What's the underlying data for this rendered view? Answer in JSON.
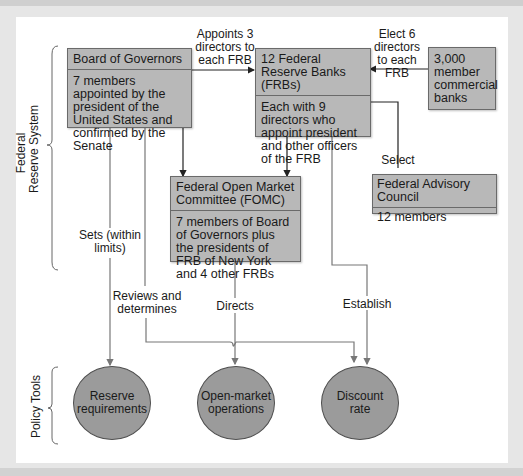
{
  "diagram": {
    "groups": {
      "federal_reserve_system": "Federal\nReserve System",
      "federal_reserve_system_line1": "Federal",
      "federal_reserve_system_line2": "Reserve System",
      "policy_tools": "Policy Tools"
    },
    "boxes": {
      "board_of_governors": {
        "title": "Board of Governors",
        "body": "7 members appointed by the president of the United States and confirmed by the Senate"
      },
      "frbs": {
        "title": "12 Federal Reserve Banks (FRBs)",
        "body": "Each with 9 directors who appoint president and other officers of the FRB"
      },
      "member_banks": {
        "body": "3,000 member commercial banks"
      },
      "fomc": {
        "title": "Federal Open Market Committee (FOMC)",
        "body": "7 members of Board of Governors plus the presidents of FRB of New York and 4 other FRBs"
      },
      "advisory_council": {
        "title": "Federal Advisory Council",
        "body": "12 members"
      }
    },
    "edge_labels": {
      "appoints": "Appoints 3 directors to each FRB",
      "elect": "Elect 6 directors to each FRB",
      "select": "Select",
      "sets": "Sets (within limits)",
      "reviews": "Reviews and determines",
      "directs": "Directs",
      "establish": "Establish"
    },
    "tools": {
      "reserve": "Reserve requirements",
      "omo": "Open-market operations",
      "discount": "Discount rate"
    },
    "colors": {
      "box_fill": "#b8b8b8",
      "circle_fill": "#9b9b9b",
      "line": "#555555",
      "background": "#ffffff",
      "frame": "#e6e6e6"
    }
  }
}
